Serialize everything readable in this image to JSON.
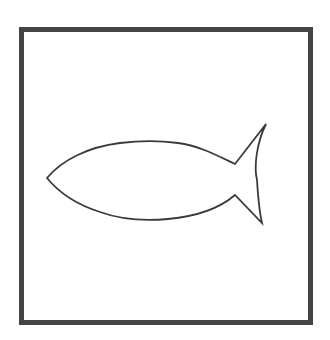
{
  "image": {
    "subject": "fish outline drawing",
    "background_color": "#ffffff",
    "stroke_color": "#3a3a3a",
    "frame": {
      "shape": "square",
      "stroke_color": "#444444",
      "stroke_width": 5
    },
    "fish": {
      "facing": "left",
      "stroke_width": 1.8,
      "fill": "none"
    }
  }
}
